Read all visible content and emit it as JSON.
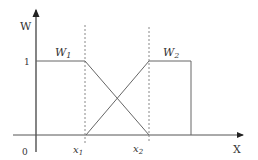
{
  "diagram": {
    "y_axis_label": "W",
    "x_axis_label": "X",
    "origin_label": "0",
    "level_label": "1",
    "curve1_label": "W",
    "curve1_sub": "1",
    "curve2_label": "W",
    "curve2_sub": "2",
    "x1_label": "x",
    "x1_sub": "1",
    "x2_label": "x",
    "x2_sub": "2",
    "line_color": "#555555",
    "dotted_color": "#888888"
  }
}
